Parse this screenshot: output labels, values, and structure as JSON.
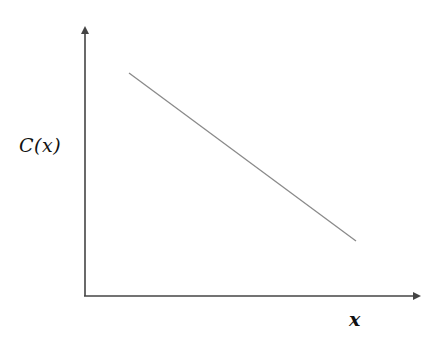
{
  "chart_data": {
    "type": "line",
    "title": "",
    "xlabel": "x",
    "ylabel": "C(x)",
    "x_ticks": [],
    "y_ticks": [],
    "grid": false,
    "legend": null,
    "series": [
      {
        "name": "C(x)",
        "description": "decreasing linear function",
        "points_px": [
          [
            129,
            73
          ],
          [
            356,
            241
          ]
        ],
        "x": [
          0.12,
          0.81
        ],
        "y": [
          0.82,
          0.2
        ]
      }
    ],
    "xlim": [
      0,
      1
    ],
    "ylim": [
      0,
      1
    ],
    "colors": {
      "axes": "#444444",
      "line": "#8a8a8a",
      "background": "#ffffff"
    }
  },
  "labels": {
    "x_axis": "x",
    "y_axis": "C(x)"
  }
}
